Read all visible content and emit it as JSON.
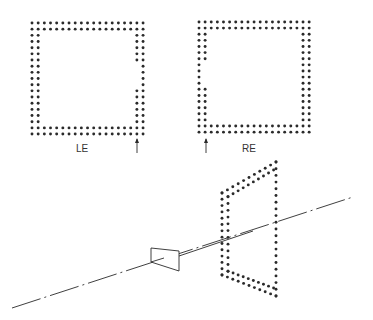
{
  "figure": {
    "background": "#ffffff",
    "ink_color": "#2a2a2a",
    "dot_radius": 1.45
  },
  "panels": [
    {
      "id": "left-eye",
      "label": "LE",
      "label_pos": [
        83,
        149
      ],
      "grid": {
        "x0": 32,
        "y0": 23,
        "spacing": 6.17,
        "cols": 19,
        "rows": 19,
        "border": 2
      },
      "gap": {
        "side": "right",
        "inner_missing_rows": [
          7,
          8,
          9,
          10
        ]
      },
      "arrow": {
        "x": 137,
        "y_tip": 138,
        "y_tail": 153
      }
    },
    {
      "id": "right-eye",
      "label": "RE",
      "label_pos": [
        249,
        149
      ],
      "grid": {
        "x0": 199,
        "y0": 22,
        "spacing": 6.12,
        "cols": 19,
        "rows": 19,
        "border": 2
      },
      "gap": {
        "side": "left",
        "inner_missing_rows": [
          7,
          8,
          9,
          10
        ]
      },
      "arrow": {
        "x": 206,
        "y_tip": 138,
        "y_tail": 153
      }
    }
  ],
  "perspective": {
    "axis_line": {
      "start": [
        12,
        308
      ],
      "end": [
        353,
        197
      ],
      "dash": "30 4 2 4"
    },
    "solid_segment": {
      "start": [
        179,
        256
      ],
      "end": [
        253,
        231
      ]
    },
    "viewer_trapezoid": [
      [
        151,
        248
      ],
      [
        179,
        251
      ],
      [
        179,
        271
      ],
      [
        151,
        262
      ]
    ],
    "frame": {
      "outer": {
        "tl": [
          222,
          193
        ],
        "tr": [
          276,
          162
        ],
        "br": [
          276,
          296
        ],
        "bl": [
          222,
          275
        ]
      },
      "inner_offset": 6,
      "dots_per_long_side": 20,
      "dots_per_short_side": 10
    }
  }
}
